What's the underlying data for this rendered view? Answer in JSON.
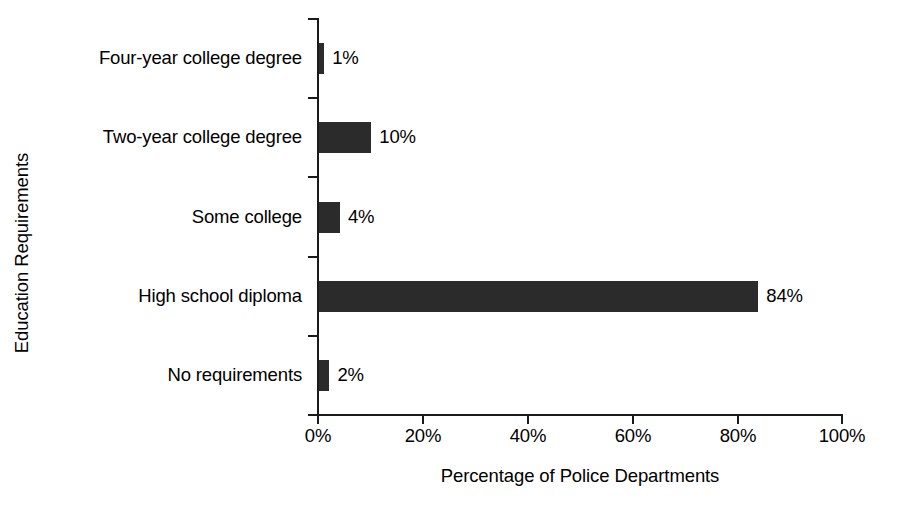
{
  "chart_data": {
    "type": "bar",
    "orientation": "horizontal",
    "title": "",
    "xlabel": "Percentage of Police Departments",
    "ylabel": "Education Requirements",
    "categories": [
      "Four-year college degree",
      "Two-year college degree",
      "Some college",
      "High school diploma",
      "No requirements"
    ],
    "values": [
      1,
      10,
      4,
      84,
      2
    ],
    "value_labels": [
      "1%",
      "10%",
      "4%",
      "84%",
      "2%"
    ],
    "xlim": [
      0,
      100
    ],
    "xticks": [
      0,
      20,
      40,
      60,
      80,
      100
    ],
    "xtick_labels": [
      "0%",
      "20%",
      "40%",
      "60%",
      "80%",
      "100%"
    ],
    "grid": false,
    "legend": false,
    "bar_color": "#2b2b2b",
    "axis_color": "#1a1a1a",
    "background_color": "#ffffff"
  }
}
